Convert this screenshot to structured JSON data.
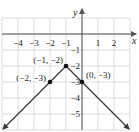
{
  "chart_data": {
    "type": "line",
    "title": "",
    "xlabel": "x",
    "ylabel": "y",
    "xlim": [
      -5,
      3.5
    ],
    "ylim": [
      -6,
      1
    ],
    "grid": true,
    "x_ticks": [
      "-4",
      "-3",
      "-2",
      "-1",
      "1",
      "2"
    ],
    "y_ticks": [
      "-1",
      "-2",
      "-3",
      "-4",
      "-5"
    ],
    "x_tick_values": [
      -4,
      -3,
      -2,
      -1,
      1,
      2
    ],
    "y_tick_values": [
      -1,
      -2,
      -3,
      -4,
      -5
    ],
    "series": [
      {
        "name": "V-shaped graph (absolute value)",
        "points": [
          [
            -6,
            -7
          ],
          [
            -1,
            -2
          ],
          [
            4,
            -7
          ]
        ],
        "arrows": "both-ends"
      }
    ],
    "labeled_points": [
      {
        "x": -1,
        "y": -2,
        "label": "(−1, −2)"
      },
      {
        "x": -2,
        "y": -3,
        "label": "(−2, −3)"
      },
      {
        "x": 0,
        "y": -3,
        "label": "(0, −3)"
      }
    ]
  },
  "px": {
    "origin_x": 82,
    "origin_y": 34,
    "unit": 16
  },
  "colors": {
    "grid": "#d4d4d4",
    "axis": "#555555",
    "line": "#3a3a3a",
    "point": "#111111"
  }
}
